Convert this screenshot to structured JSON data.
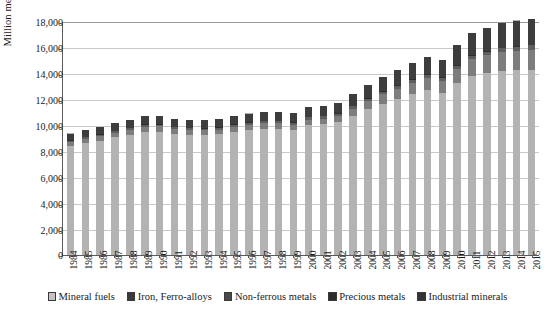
{
  "chart_data": {
    "type": "bar",
    "stacked": true,
    "title": "",
    "xlabel": "",
    "ylabel": "Million metric tons",
    "ylim": [
      0,
      18000
    ],
    "ytick_step": 2000,
    "ytick_labels": [
      "0",
      "2,000",
      "4,000",
      "6,000",
      "8,000",
      "10,000",
      "12,000",
      "14,000",
      "16,000",
      "18,000"
    ],
    "grid": true,
    "legend_position": "bottom",
    "categories": [
      "1984",
      "1985",
      "1986",
      "1987",
      "1988",
      "1989",
      "1990",
      "1991",
      "1992",
      "1993",
      "1994",
      "1995",
      "1996",
      "1997",
      "1998",
      "1999",
      "2000",
      "2001",
      "2002",
      "2003",
      "2004",
      "2005",
      "2006",
      "2007",
      "2008",
      "2009",
      "2010",
      "2011",
      "2012",
      "2013",
      "2014",
      "2015"
    ],
    "series": [
      {
        "name": "Mineral fuels",
        "color": "#b3b3b3",
        "values": [
          8350,
          8600,
          8800,
          9050,
          9200,
          9480,
          9500,
          9320,
          9250,
          9230,
          9280,
          9480,
          9620,
          9700,
          9720,
          9620,
          9980,
          10050,
          10200,
          10700,
          11200,
          11650,
          12000,
          12350,
          12700,
          12450,
          13200,
          13800,
          14000,
          14150,
          14200,
          14250
        ]
      },
      {
        "name": "Iron, Ferro-alloys",
        "color": "#7d7d7d",
        "values": [
          330,
          340,
          340,
          350,
          400,
          400,
          390,
          370,
          360,
          360,
          370,
          400,
          400,
          420,
          420,
          410,
          440,
          450,
          480,
          560,
          640,
          720,
          800,
          880,
          920,
          960,
          1120,
          1250,
          1350,
          1450,
          1520,
          1560
        ]
      },
      {
        "name": "Non-ferrous metals",
        "color": "#5e5e5e",
        "values": [
          120,
          125,
          125,
          130,
          135,
          140,
          140,
          135,
          135,
          135,
          140,
          145,
          150,
          155,
          155,
          155,
          165,
          165,
          170,
          180,
          195,
          205,
          215,
          230,
          235,
          230,
          255,
          270,
          280,
          295,
          305,
          315
        ]
      },
      {
        "name": "Precious metals",
        "color": "#2e2e2e",
        "values": [
          30,
          30,
          30,
          32,
          33,
          34,
          34,
          33,
          33,
          33,
          34,
          35,
          36,
          37,
          37,
          37,
          39,
          39,
          40,
          42,
          45,
          47,
          49,
          52,
          53,
          52,
          57,
          60,
          62,
          65,
          67,
          68
        ]
      },
      {
        "name": "Industrial minerals",
        "color": "#3d3d3d",
        "values": [
          520,
          540,
          560,
          580,
          610,
          650,
          640,
          620,
          610,
          610,
          630,
          660,
          680,
          700,
          700,
          690,
          730,
          750,
          790,
          880,
          980,
          1080,
          1180,
          1280,
          1340,
          1300,
          1510,
          1680,
          1780,
          1880,
          1950,
          2000
        ]
      }
    ]
  }
}
